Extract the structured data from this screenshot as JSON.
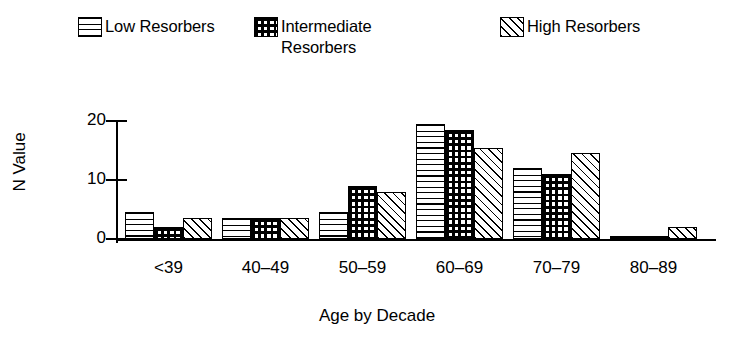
{
  "legend": {
    "items": [
      {
        "label": "Low Resorbers",
        "pattern": "horizontal-lines",
        "swatch_name": "legend-swatch-low-resorbers"
      },
      {
        "label": "Intermediate\nResorbers",
        "pattern": "grid-crosshatch",
        "swatch_name": "legend-swatch-intermediate-resorbers"
      },
      {
        "label": "High Resorbers",
        "pattern": "diagonal-hatch",
        "swatch_name": "legend-swatch-high-resorbers"
      }
    ]
  },
  "axes": {
    "ylabel": "N Value",
    "xlabel": "Age by Decade",
    "yticks": [
      "0",
      "10",
      "20"
    ]
  },
  "chart_data": {
    "type": "bar",
    "title": "",
    "xlabel": "Age by Decade",
    "ylabel": "N Value",
    "categories": [
      "<39",
      "40–49",
      "50–59",
      "60–69",
      "70–79",
      "80–89"
    ],
    "series": [
      {
        "name": "Low Resorbers",
        "values": [
          4.5,
          3.5,
          4.5,
          19.5,
          12,
          0.3
        ]
      },
      {
        "name": "Intermediate Resorbers",
        "values": [
          2,
          3.5,
          9,
          18.5,
          11,
          0.3
        ]
      },
      {
        "name": "High Resorbers",
        "values": [
          3.5,
          3.5,
          8,
          15.5,
          14.5,
          2
        ]
      }
    ],
    "ylim": [
      0,
      20
    ],
    "ytick_values": [
      0,
      10,
      20
    ],
    "grid": false,
    "legend_position": "top",
    "colors": {
      "outline": "#000000",
      "background": "#ffffff"
    }
  }
}
